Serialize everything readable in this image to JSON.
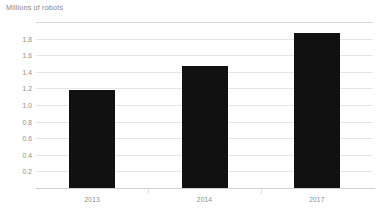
{
  "chart_data": {
    "type": "bar",
    "title": "Millions of robots",
    "xlabel": "",
    "ylabel": "",
    "categories": [
      "2013",
      "2014",
      "2017"
    ],
    "values": [
      1.18,
      1.47,
      1.87
    ],
    "series": [
      {
        "name": "Millions of robots",
        "values": [
          1.18,
          1.47,
          1.87
        ]
      }
    ],
    "ylim": [
      0,
      2.0
    ],
    "y_ticks": [
      0.2,
      0.4,
      0.6,
      0.8,
      1.0,
      1.2,
      1.4,
      1.6,
      1.8
    ],
    "y_tick_labels": [
      "0.2",
      "0.4",
      "0.6",
      "0.8",
      "1.0",
      "1.2",
      "1.4",
      "1.6",
      "1.8"
    ],
    "grid": true,
    "grid_axis": "y",
    "legend": false,
    "legend_position": "none",
    "bar_color": "#111111",
    "grid_color": "#e6e6e6",
    "text_color": "#8c8c91",
    "background": "#ffffff",
    "annotations": []
  },
  "chart": {
    "title": "Millions of robots"
  }
}
